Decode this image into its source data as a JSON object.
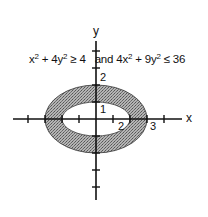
{
  "diagram": {
    "type": "region-between-ellipses",
    "condition": {
      "part1_lhs": "x",
      "part1_exp1": "2",
      "part1_mid": " + 4y",
      "part1_exp2": "2",
      "part1_rhs": " ≥ 4",
      "connector": " and ",
      "part2_lhs": "4x",
      "part2_exp1": "2",
      "part2_mid": " + 9y",
      "part2_exp2": "2",
      "part2_rhs": " ≤ 36"
    },
    "axes": {
      "x_label": "x",
      "y_label": "y",
      "x_range": [
        -4,
        4
      ],
      "y_range": [
        -4,
        4
      ]
    },
    "tick_labels": {
      "x_2": "2",
      "x_3": "3",
      "y_1": "1",
      "y_2": "2"
    },
    "inner_ellipse": {
      "equation": "x^2 + 4y^2 = 4",
      "semi_x": 2,
      "semi_y": 1
    },
    "outer_ellipse": {
      "equation": "4x^2 + 9y^2 = 36",
      "semi_x": 3,
      "semi_y": 2
    },
    "shade_color": "#9a9a9a"
  }
}
